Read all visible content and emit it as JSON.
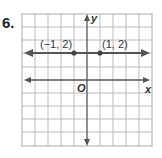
{
  "problem": {
    "number": "6."
  },
  "graph": {
    "x_axis_label": "x",
    "y_axis_label": "y",
    "origin_label": "O",
    "grid": {
      "columns": 10,
      "rows": 10,
      "x_range": [
        -5,
        5
      ],
      "y_range": [
        -5,
        5
      ]
    },
    "points": [
      {
        "label": "(−1, 2)",
        "x": -1,
        "y": 2
      },
      {
        "label": "(1, 2)",
        "x": 1,
        "y": 2
      }
    ],
    "line": {
      "equation": "y = 2",
      "through": [
        [
          -1,
          2
        ],
        [
          1,
          2
        ]
      ]
    }
  }
}
